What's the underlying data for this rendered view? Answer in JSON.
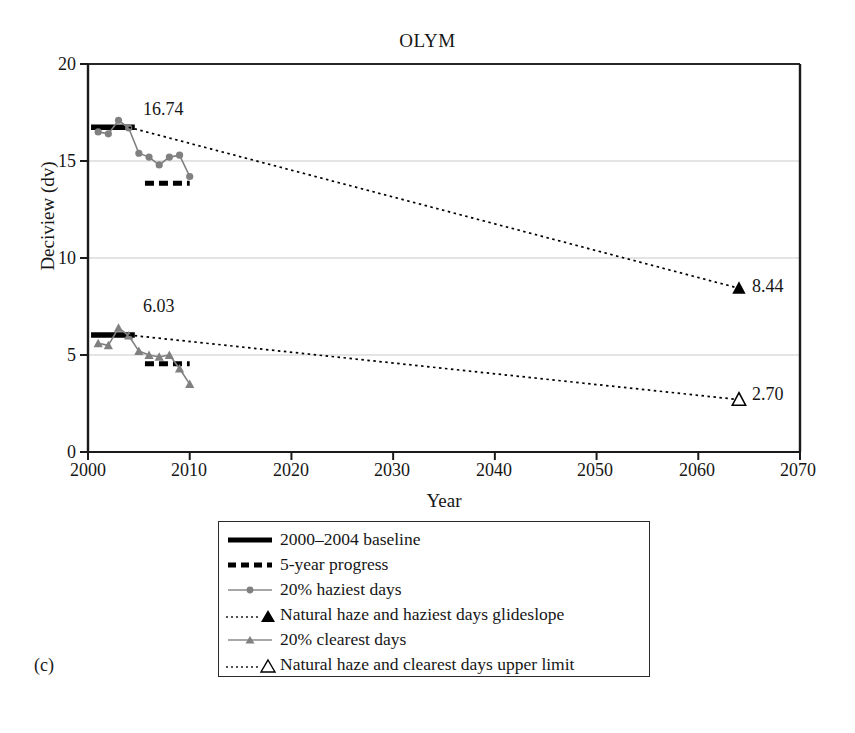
{
  "figure": {
    "panel_label": "(c)",
    "title": "OLYM"
  },
  "chart_data": {
    "type": "line",
    "title": "OLYM",
    "xlabel": "Year",
    "ylabel": "Deciview (dv)",
    "xlim": [
      2000,
      2070
    ],
    "ylim": [
      0,
      20
    ],
    "xticks": [
      2000,
      2010,
      2020,
      2030,
      2040,
      2050,
      2060,
      2070
    ],
    "yticks": [
      0,
      5,
      10,
      15,
      20
    ],
    "grid": "horizontal",
    "legend_position": "below-axes",
    "annotations": [
      {
        "label": "16.74",
        "x": 2004.0,
        "y": 16.74,
        "series": "2000-2004 baseline (haziest)"
      },
      {
        "label": "6.03",
        "x": 2004.0,
        "y": 6.03,
        "series": "2000-2004 baseline (clearest)"
      },
      {
        "label": "8.44",
        "x": 2064.0,
        "y": 8.44,
        "series": "Natural haze and haziest days glideslope"
      },
      {
        "label": "2.70",
        "x": 2064.0,
        "y": 2.7,
        "series": "Natural haze and clearest days upper limit"
      }
    ],
    "series": [
      {
        "name": "2000–2004 baseline",
        "type": "baseline-bar",
        "style": "solid-thick-black",
        "color": "#000000",
        "x_range": [
          2000.3,
          2004.6
        ],
        "value": 16.74
      },
      {
        "name": "2000–2004 baseline (clearest)",
        "type": "baseline-bar",
        "style": "solid-thick-black",
        "color": "#000000",
        "x_range": [
          2000.3,
          2004.6
        ],
        "value": 6.03
      },
      {
        "name": "5-year progress",
        "type": "progress-bar",
        "style": "dashed-thick-black",
        "color": "#000000",
        "x_range": [
          2005.6,
          2010.0
        ],
        "value": 13.85
      },
      {
        "name": "5-year progress (clearest)",
        "type": "progress-bar",
        "style": "dashed-thick-black",
        "color": "#000000",
        "x_range": [
          2005.6,
          2010.0
        ],
        "value": 4.55
      },
      {
        "name": "20% haziest days",
        "type": "line-markers",
        "style": "solid-gray-circles",
        "color": "#808080",
        "x": [
          2001,
          2002,
          2003,
          2004,
          2005,
          2006,
          2007,
          2008,
          2009,
          2010
        ],
        "values": [
          16.5,
          16.4,
          17.1,
          16.7,
          15.4,
          15.2,
          14.8,
          15.2,
          15.3,
          14.2
        ]
      },
      {
        "name": "20% clearest days",
        "type": "line-markers",
        "style": "solid-gray-triangles",
        "color": "#808080",
        "x": [
          2001,
          2002,
          2003,
          2004,
          2005,
          2006,
          2007,
          2008,
          2009,
          2010
        ],
        "values": [
          5.6,
          5.5,
          6.4,
          6.0,
          5.2,
          5.0,
          4.9,
          5.0,
          4.3,
          3.5
        ]
      },
      {
        "name": "Natural haze and haziest days glideslope",
        "type": "glideslope",
        "style": "dotted-black",
        "color": "#000000",
        "x": [
          2004,
          2064
        ],
        "values": [
          16.74,
          8.44
        ],
        "endpoint_marker": "filled-triangle"
      },
      {
        "name": "Natural haze and clearest days upper limit",
        "type": "glideslope",
        "style": "dotted-black",
        "color": "#000000",
        "x": [
          2004,
          2064
        ],
        "values": [
          6.03,
          2.7
        ],
        "endpoint_marker": "open-triangle"
      }
    ]
  },
  "axes": {
    "y_title": "Deciview (dv)",
    "x_title": "Year",
    "y_ticks": [
      "0",
      "5",
      "10",
      "15",
      "20"
    ],
    "x_ticks": [
      "2000",
      "2010",
      "2020",
      "2030",
      "2040",
      "2050",
      "2060",
      "2070"
    ]
  },
  "legend": {
    "items": [
      {
        "label": "2000–2004 baseline",
        "icon": "solid-thick-line-icon"
      },
      {
        "label": "5-year progress",
        "icon": "dashed-thick-line-icon"
      },
      {
        "label": "20% haziest days",
        "icon": "gray-line-circle-marker-icon"
      },
      {
        "label": "Natural haze and haziest days glideslope",
        "icon": "dotted-line-filled-triangle-icon"
      },
      {
        "label": "20% clearest days",
        "icon": "gray-line-triangle-marker-icon"
      },
      {
        "label": "Natural haze and clearest days upper limit",
        "icon": "dotted-line-open-triangle-icon"
      }
    ]
  },
  "colors": {
    "series_gray": "#808080",
    "axis_black": "#1a1a1a",
    "grid_gray": "#c9c9c9"
  }
}
